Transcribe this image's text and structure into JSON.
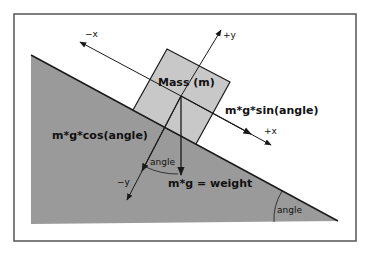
{
  "diagram": {
    "colors": {
      "background": "#ffffff",
      "frame": "#555555",
      "slope": "#9a9a9a",
      "mass_box": "#c8c8c8",
      "lines": "#1a1a1a"
    },
    "labels": {
      "mass": "Mass  (m)",
      "neg_x": "−x",
      "pos_x": "+x",
      "pos_y": "+y",
      "neg_y": "−y",
      "parallel_force": "m*g*sin(angle)",
      "normal_force": "m*g*cos(angle)",
      "weight": "m*g = weight",
      "angle_between_weight_and_neg_y": "angle",
      "incline_angle": "angle"
    }
  }
}
